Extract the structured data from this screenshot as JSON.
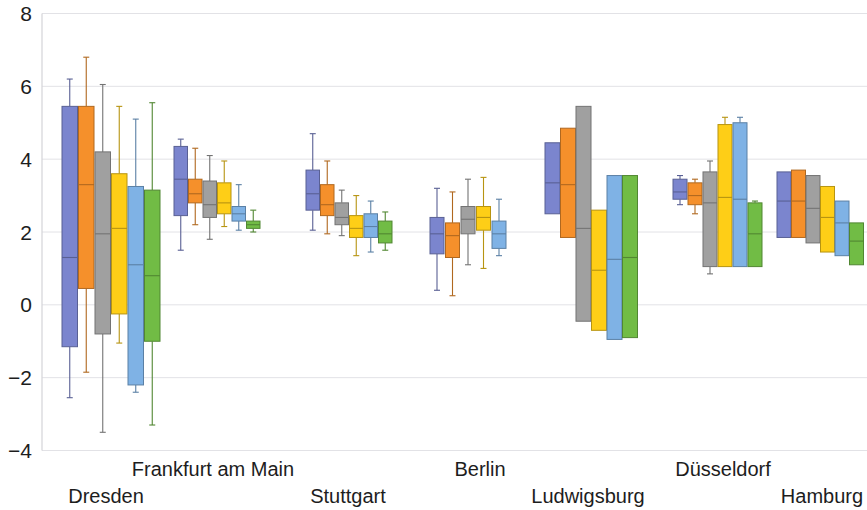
{
  "chart_data": {
    "type": "box",
    "title": "",
    "xlabel": "",
    "ylabel": "",
    "ylim": [
      -4,
      8
    ],
    "yticks": [
      8,
      6,
      4,
      2,
      0,
      -2,
      -4
    ],
    "ytick_labels": [
      "8",
      "6",
      "4",
      "2",
      "0",
      "−2",
      "−4"
    ],
    "grid": true,
    "legend": "none",
    "categories": [
      "Dresden",
      "Frankfurt am Main",
      "Stuttgart",
      "Berlin",
      "Ludwigsburg",
      "Düsseldorf",
      "Hamburg"
    ],
    "series_colors": {
      "blue": "#7b85ce",
      "orange": "#f5902b",
      "gray": "#a0a0a0",
      "yellow": "#fece17",
      "lightblue": "#7fb2e5",
      "green": "#71bc45"
    },
    "series_names": [
      "blue",
      "orange",
      "gray",
      "yellow",
      "lightblue",
      "green"
    ],
    "groups": [
      {
        "category": "Dresden",
        "boxes": [
          {
            "series": "blue",
            "whisker_low": -2.55,
            "q1": -1.15,
            "median": 1.3,
            "q3": 5.45,
            "whisker_high": 6.2
          },
          {
            "series": "orange",
            "whisker_low": -1.85,
            "q1": 0.45,
            "median": 3.3,
            "q3": 5.45,
            "whisker_high": 6.8
          },
          {
            "series": "gray",
            "whisker_low": -3.5,
            "q1": -0.8,
            "median": 1.95,
            "q3": 4.2,
            "whisker_high": 6.05
          },
          {
            "series": "yellow",
            "whisker_low": -1.05,
            "q1": -0.25,
            "median": 2.1,
            "q3": 3.6,
            "whisker_high": 5.45
          },
          {
            "series": "lightblue",
            "whisker_low": -2.4,
            "q1": -2.2,
            "median": 1.1,
            "q3": 3.25,
            "whisker_high": 5.1
          },
          {
            "series": "green",
            "whisker_low": -3.3,
            "q1": -1.0,
            "median": 0.8,
            "q3": 3.15,
            "whisker_high": 5.55
          }
        ]
      },
      {
        "category": "Frankfurt am Main",
        "boxes": [
          {
            "series": "blue",
            "whisker_low": 1.5,
            "q1": 2.45,
            "median": 3.45,
            "q3": 4.35,
            "whisker_high": 4.55
          },
          {
            "series": "orange",
            "whisker_low": 2.2,
            "q1": 2.8,
            "median": 3.05,
            "q3": 3.45,
            "whisker_high": 4.3
          },
          {
            "series": "gray",
            "whisker_low": 1.8,
            "q1": 2.4,
            "median": 2.75,
            "q3": 3.4,
            "whisker_high": 4.1
          },
          {
            "series": "yellow",
            "whisker_low": 2.15,
            "q1": 2.5,
            "median": 2.8,
            "q3": 3.35,
            "whisker_high": 3.95
          },
          {
            "series": "lightblue",
            "whisker_low": 2.05,
            "q1": 2.3,
            "median": 2.5,
            "q3": 2.7,
            "whisker_high": 3.3
          },
          {
            "series": "green",
            "whisker_low": 2.0,
            "q1": 2.1,
            "median": 2.2,
            "q3": 2.3,
            "whisker_high": 2.6
          }
        ]
      },
      {
        "category": "Stuttgart",
        "boxes": [
          {
            "series": "blue",
            "whisker_low": 2.05,
            "q1": 2.6,
            "median": 3.05,
            "q3": 3.7,
            "whisker_high": 4.7
          },
          {
            "series": "orange",
            "whisker_low": 1.95,
            "q1": 2.45,
            "median": 2.75,
            "q3": 3.3,
            "whisker_high": 3.95
          },
          {
            "series": "gray",
            "whisker_low": 1.9,
            "q1": 2.2,
            "median": 2.4,
            "q3": 2.8,
            "whisker_high": 3.15
          },
          {
            "series": "yellow",
            "whisker_low": 1.35,
            "q1": 1.85,
            "median": 2.1,
            "q3": 2.45,
            "whisker_high": 3.0
          },
          {
            "series": "lightblue",
            "whisker_low": 1.45,
            "q1": 1.85,
            "median": 2.15,
            "q3": 2.5,
            "whisker_high": 2.85
          },
          {
            "series": "green",
            "whisker_low": 1.5,
            "q1": 1.7,
            "median": 1.95,
            "q3": 2.3,
            "whisker_high": 2.55
          }
        ]
      },
      {
        "category": "Berlin",
        "boxes": [
          {
            "series": "blue",
            "whisker_low": 0.4,
            "q1": 1.4,
            "median": 1.95,
            "q3": 2.4,
            "whisker_high": 3.2
          },
          {
            "series": "orange",
            "whisker_low": 0.25,
            "q1": 1.3,
            "median": 1.9,
            "q3": 2.25,
            "whisker_high": 3.1
          },
          {
            "series": "gray",
            "whisker_low": 1.1,
            "q1": 1.95,
            "median": 2.35,
            "q3": 2.7,
            "whisker_high": 3.45
          },
          {
            "series": "yellow",
            "whisker_low": 1.0,
            "q1": 2.05,
            "median": 2.4,
            "q3": 2.7,
            "whisker_high": 3.5
          },
          {
            "series": "lightblue",
            "whisker_low": 1.35,
            "q1": 1.55,
            "median": 1.95,
            "q3": 2.3,
            "whisker_high": 2.9
          }
        ]
      },
      {
        "category": "Ludwigsburg",
        "boxes": [
          {
            "series": "blue",
            "whisker_low": 2.5,
            "q1": 2.5,
            "median": 3.35,
            "q3": 4.45,
            "whisker_high": 4.45
          },
          {
            "series": "orange",
            "whisker_low": 1.85,
            "q1": 1.85,
            "median": 3.3,
            "q3": 4.85,
            "whisker_high": 4.85
          },
          {
            "series": "gray",
            "whisker_low": -0.45,
            "q1": -0.45,
            "median": 2.1,
            "q3": 5.45,
            "whisker_high": 5.45
          },
          {
            "series": "yellow",
            "whisker_low": -0.7,
            "q1": -0.7,
            "median": 0.95,
            "q3": 2.6,
            "whisker_high": 2.6
          },
          {
            "series": "lightblue",
            "whisker_low": -0.95,
            "q1": -0.95,
            "median": 1.25,
            "q3": 3.55,
            "whisker_high": 3.55
          },
          {
            "series": "green",
            "whisker_low": -0.9,
            "q1": -0.9,
            "median": 1.3,
            "q3": 3.55,
            "whisker_high": 3.55
          }
        ]
      },
      {
        "category": "Düsseldorf",
        "boxes": [
          {
            "series": "blue",
            "whisker_low": 2.75,
            "q1": 2.9,
            "median": 3.1,
            "q3": 3.45,
            "whisker_high": 3.55
          },
          {
            "series": "orange",
            "whisker_low": 2.5,
            "q1": 2.75,
            "median": 3.0,
            "q3": 3.35,
            "whisker_high": 3.45
          },
          {
            "series": "gray",
            "whisker_low": 0.85,
            "q1": 1.05,
            "median": 2.8,
            "q3": 3.65,
            "whisker_high": 3.95
          },
          {
            "series": "yellow",
            "whisker_low": 1.05,
            "q1": 1.05,
            "median": 2.95,
            "q3": 4.95,
            "whisker_high": 5.15
          },
          {
            "series": "lightblue",
            "whisker_low": 1.05,
            "q1": 1.05,
            "median": 2.9,
            "q3": 5.0,
            "whisker_high": 5.15
          },
          {
            "series": "green",
            "whisker_low": 1.05,
            "q1": 1.05,
            "median": 1.95,
            "q3": 2.8,
            "whisker_high": 2.85
          }
        ]
      },
      {
        "category": "Hamburg",
        "boxes": [
          {
            "series": "blue",
            "whisker_low": 1.85,
            "q1": 1.85,
            "median": 2.85,
            "q3": 3.65,
            "whisker_high": 3.65
          },
          {
            "series": "orange",
            "whisker_low": 1.85,
            "q1": 1.85,
            "median": 2.85,
            "q3": 3.7,
            "whisker_high": 3.7
          },
          {
            "series": "gray",
            "whisker_low": 1.7,
            "q1": 1.7,
            "median": 2.65,
            "q3": 3.55,
            "whisker_high": 3.55
          },
          {
            "series": "yellow",
            "whisker_low": 1.45,
            "q1": 1.45,
            "median": 2.4,
            "q3": 3.25,
            "whisker_high": 3.25
          },
          {
            "series": "lightblue",
            "whisker_low": 1.35,
            "q1": 1.35,
            "median": 2.25,
            "q3": 2.85,
            "whisker_high": 2.85
          },
          {
            "series": "green",
            "whisker_low": 1.1,
            "q1": 1.1,
            "median": 1.75,
            "q3": 2.25,
            "whisker_high": 2.25
          }
        ]
      }
    ],
    "category_label_rows": [
      {
        "label": "Dresden",
        "x": 106,
        "row": 1
      },
      {
        "label": "Frankfurt am Main",
        "x": 213,
        "row": 0
      },
      {
        "label": "Stuttgart",
        "x": 348,
        "row": 1
      },
      {
        "label": "Berlin",
        "x": 480,
        "row": 0
      },
      {
        "label": "Ludwigsburg",
        "x": 588,
        "row": 1
      },
      {
        "label": "Düsseldorf",
        "x": 723,
        "row": 0
      },
      {
        "label": "Hamburg",
        "x": 822,
        "row": 1
      }
    ]
  },
  "axis": {
    "y_min_label": "−4",
    "y_max_label": "8"
  }
}
